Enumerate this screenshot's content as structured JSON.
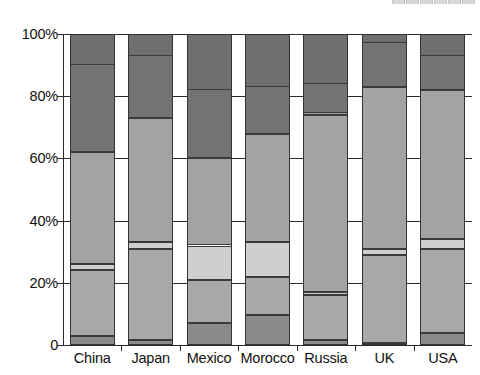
{
  "top_legend_remnant": {
    "visible": true,
    "note": "cut-off legend text at top edge, illegible",
    "text": "",
    "swatch_count": 6
  },
  "axis": {
    "y_ticks": [
      "100%",
      "80%",
      "60%",
      "40%",
      "20%",
      "0"
    ],
    "y_tick_values": [
      100,
      80,
      60,
      40,
      20,
      0
    ],
    "x_categories": [
      "China",
      "Japan",
      "Mexico",
      "Morocco",
      "Russia",
      "UK",
      "USA"
    ]
  },
  "colors": {
    "segment_1": "#8a8a8a",
    "segment_2": "#a8a8a8",
    "segment_3": "#cfcfcf",
    "segment_4": "#a3a3a3",
    "segment_5": "#737373",
    "axis": "#2b2b2b",
    "outline": "#333333",
    "background": "#ffffff"
  },
  "chart_data": {
    "type": "bar",
    "title": "",
    "subtitle": "",
    "xlabel": "",
    "ylabel": "",
    "ylim": [
      0,
      100
    ],
    "stacked": true,
    "normalized_100": true,
    "grid": true,
    "legend_position": "top",
    "categories": [
      "China",
      "Japan",
      "Mexico",
      "Morocco",
      "Russia",
      "UK",
      "USA"
    ],
    "series": [
      {
        "name": "Segment 1",
        "color": "#8a8a8a",
        "values": [
          3.0,
          1.5,
          7.0,
          9.5,
          1.5,
          0.5,
          4.0
        ]
      },
      {
        "name": "Segment 2",
        "color": "#a8a8a8",
        "values": [
          21.0,
          29.5,
          14.0,
          12.5,
          14.5,
          28.5,
          27.0
        ]
      },
      {
        "name": "Segment 3",
        "color": "#cfcfcf",
        "values": [
          2.0,
          2.0,
          11.0,
          11.0,
          1.0,
          2.0,
          3.0
        ]
      },
      {
        "name": "Segment 4",
        "color": "#a3a3a3",
        "values": [
          36.0,
          40.0,
          28.0,
          35.0,
          57.0,
          52.0,
          48.0
        ]
      },
      {
        "name": "Segment 5",
        "color": "#737373",
        "values": [
          38.0,
          27.0,
          40.0,
          32.0,
          26.0,
          17.0,
          18.0
        ]
      }
    ],
    "cumulative_boundaries": {
      "China": [
        0,
        3.0,
        24.0,
        26.0,
        62.0,
        100
      ],
      "Japan": [
        0,
        1.5,
        31.0,
        33.0,
        73.0,
        100
      ],
      "Mexico": [
        0,
        7.0,
        21.0,
        32.0,
        60.0,
        100
      ],
      "Morocco": [
        0,
        9.5,
        22.0,
        33.0,
        68.0,
        100
      ],
      "Russia": [
        0,
        1.5,
        16.0,
        17.0,
        74.0,
        100
      ],
      "UK": [
        0,
        0.5,
        29.0,
        31.0,
        83.0,
        100
      ],
      "USA": [
        0,
        4.0,
        31.0,
        34.0,
        82.0,
        100
      ]
    },
    "top_dark_cap": {
      "note": "topmost darkest band per bar (upper sub-part of segment 5)",
      "China": [
        90,
        100
      ],
      "Japan": [
        93,
        100
      ],
      "Mexico": [
        82,
        100
      ],
      "Morocco": [
        83,
        100
      ],
      "Russia": [
        84,
        100
      ],
      "UK": [
        97,
        100
      ],
      "USA": [
        93,
        100
      ]
    },
    "russia_extra_band": {
      "from": 74,
      "to": 75
    }
  }
}
